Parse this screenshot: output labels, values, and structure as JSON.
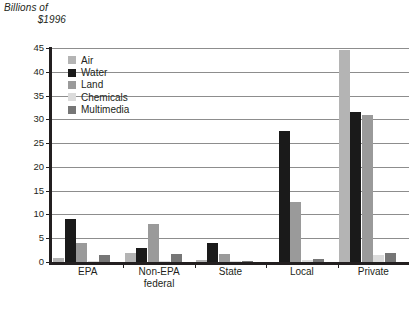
{
  "chart_data": {
    "type": "bar",
    "title": "",
    "xlabel": "",
    "ylabel": "Billions of $1996",
    "ylabel_line1": "Billions of",
    "ylabel_line2": "$1996",
    "ylim": [
      0,
      45
    ],
    "ytick_step": 5,
    "yticks": [
      45,
      40,
      35,
      30,
      25,
      20,
      15,
      10,
      5,
      0
    ],
    "ytick_labels": [
      "45",
      "40",
      "35",
      "30",
      "25",
      "20",
      "15",
      "10",
      "5",
      "0"
    ],
    "grid": true,
    "grid_axis": "y",
    "legend_position": "upper-left-inside",
    "categories": [
      "EPA",
      "Non-EPA federal",
      "State",
      "Local",
      "Private"
    ],
    "category_labels": [
      {
        "line1": "EPA",
        "line2": ""
      },
      {
        "line1": "Non-EPA",
        "line2": "federal"
      },
      {
        "line1": "State",
        "line2": ""
      },
      {
        "line1": "Local",
        "line2": ""
      },
      {
        "line1": "Private",
        "line2": ""
      }
    ],
    "series": [
      {
        "name": "Air",
        "color": "#b4b4b4",
        "values": [
          0.8,
          2.0,
          0.5,
          0.0,
          44.5
        ]
      },
      {
        "name": "Water",
        "color": "#1a1a1a",
        "values": [
          9.0,
          3.0,
          4.0,
          27.5,
          31.5
        ]
      },
      {
        "name": "Land",
        "color": "#9a9a9a",
        "values": [
          4.0,
          8.0,
          1.6,
          12.7,
          31.0
        ]
      },
      {
        "name": "Chemicals",
        "color": "#dcdcdc",
        "values": [
          0.2,
          0.2,
          0.1,
          0.5,
          1.5
        ]
      },
      {
        "name": "Multimedia",
        "color": "#767676",
        "values": [
          1.5,
          1.7,
          0.2,
          0.7,
          2.0
        ]
      }
    ]
  },
  "legend": {
    "items": [
      {
        "label": "Air",
        "color": "#b4b4b4"
      },
      {
        "label": "Water",
        "color": "#1a1a1a"
      },
      {
        "label": "Land",
        "color": "#9a9a9a"
      },
      {
        "label": "Chemicals",
        "color": "#dcdcdc"
      },
      {
        "label": "Multimedia",
        "color": "#767676"
      }
    ]
  },
  "caption": "",
  "colors": {
    "axis": "#231f20",
    "grid": "#8d8d8d",
    "background": "#ffffff",
    "text": "#231f20"
  }
}
